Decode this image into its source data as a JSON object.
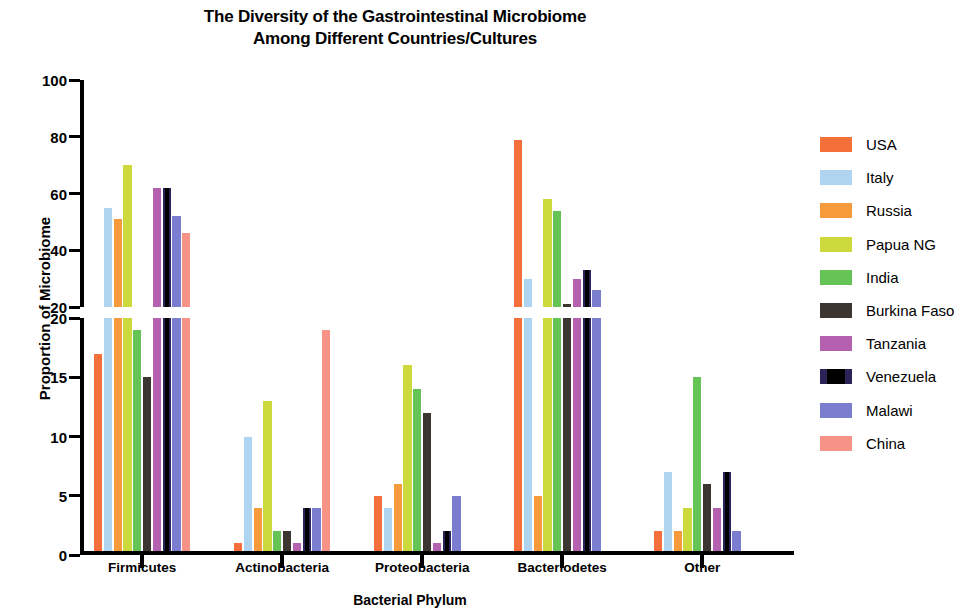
{
  "chart_data": {
    "type": "bar",
    "title": "The Diversity of the Gastrointestinal Microbiome Among Different Countries/Cultures",
    "title_line1": "The Diversity of the Gastrointestinal Microbiome",
    "title_line2": "Among Different Countries/Cultures",
    "xlabel": "Bacterial Phylum",
    "ylabel": "Proportion of Microbiome",
    "grid": false,
    "legend_position": "right",
    "broken_axis": true,
    "axis_lower": {
      "ylim": [
        0,
        20
      ],
      "ticks": [
        0,
        5,
        10,
        15,
        20
      ]
    },
    "axis_upper": {
      "ylim": [
        20,
        100
      ],
      "ticks": [
        20,
        40,
        60,
        80,
        100
      ]
    },
    "categories": [
      "Firmicutes",
      "Actinobacteria",
      "Proteobacteria",
      "Bacteriodetes",
      "Other"
    ],
    "series": [
      {
        "name": "USA",
        "color": "#f4703a",
        "values": [
          17,
          1,
          5,
          79,
          2
        ]
      },
      {
        "name": "Italy",
        "color": "#aed4f0",
        "values": [
          55,
          10,
          4,
          30,
          7
        ]
      },
      {
        "name": "Russia",
        "color": "#f79a3c",
        "values": [
          51,
          4,
          6,
          5,
          2
        ]
      },
      {
        "name": "Papua NG",
        "color": "#cbd93c",
        "values": [
          70,
          13,
          16,
          58,
          4
        ]
      },
      {
        "name": "India",
        "color": "#66c355",
        "values": [
          19,
          2,
          14,
          54,
          15
        ]
      },
      {
        "name": "Burkina Faso",
        "color": "#3b3631",
        "values": [
          15,
          2,
          12,
          21,
          6
        ]
      },
      {
        "name": "Tanzania",
        "color": "#b濃",
        "values": [
          62,
          1,
          1,
          30,
          4
        ]
      },
      {
        "name": "Venezuela",
        "color": "#100d1e",
        "values": [
          62,
          4,
          2,
          33,
          7
        ]
      },
      {
        "name": "Malawi",
        "color": "#7b7dce",
        "values": [
          52,
          4,
          5,
          26,
          2
        ]
      },
      {
        "name": "China",
        "color": "#f79287",
        "values": [
          46,
          19,
          0,
          0,
          0
        ]
      }
    ]
  },
  "legend": {
    "items": [
      {
        "label": "USA",
        "color": "#f4703a"
      },
      {
        "label": "Italy",
        "color": "#aed4f0"
      },
      {
        "label": "Russia",
        "color": "#f79a3c"
      },
      {
        "label": "Papua NG",
        "color": "#cbd93c"
      },
      {
        "label": "India",
        "color": "#66c355"
      },
      {
        "label": "Burkina Faso",
        "color": "#3b3631"
      },
      {
        "label": "Tanzania",
        "color": "#b濃",
        "color_fix": "#b濃"
      },
      {
        "label": "Venezuela",
        "color": "#100d1e"
      },
      {
        "label": "Malawi",
        "color": "#7b7dce"
      },
      {
        "label": "China",
        "color": "#f79287"
      }
    ]
  }
}
